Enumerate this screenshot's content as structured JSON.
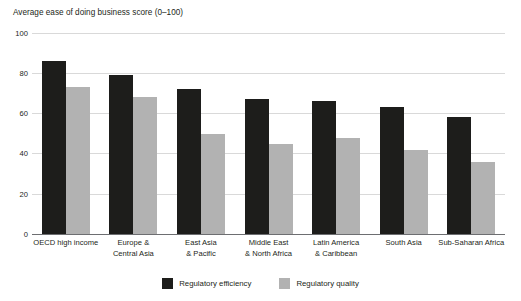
{
  "chart_data": {
    "type": "bar",
    "title": "",
    "ylabel": "Average ease of doing business score (0–100)",
    "xlabel": "",
    "ylim": [
      0,
      100
    ],
    "yticks": [
      100,
      80,
      60,
      40,
      20,
      0
    ],
    "grid": true,
    "legend_position": "bottom-center",
    "categories": [
      "OECD high income",
      "Europe & Central Asia",
      "East Asia & Pacific",
      "Middle East & North Africa",
      "Latin America & Caribbean",
      "South Asia",
      "Sub-Saharan Africa"
    ],
    "category_lines": [
      [
        "OECD high income"
      ],
      [
        "Europe &",
        "Central Asia"
      ],
      [
        "East Asia",
        "& Pacific"
      ],
      [
        "Middle East",
        "& North Africa"
      ],
      [
        "Latin America",
        "& Caribbean"
      ],
      [
        "South Asia"
      ],
      [
        "Sub-Saharan Africa"
      ]
    ],
    "series": [
      {
        "name": "Regulatory efficiency",
        "color": "#1d1d1b",
        "values": [
          86,
          79,
          72,
          67,
          66,
          63,
          58
        ]
      },
      {
        "name": "Regulatory quality",
        "color": "#b2b2b2",
        "values": [
          73,
          68,
          50,
          45,
          48,
          42,
          36
        ]
      }
    ]
  },
  "legend": {
    "items": [
      {
        "label": "Regulatory efficiency",
        "color": "#1d1d1b"
      },
      {
        "label": "Regulatory quality",
        "color": "#b2b2b2"
      }
    ]
  }
}
